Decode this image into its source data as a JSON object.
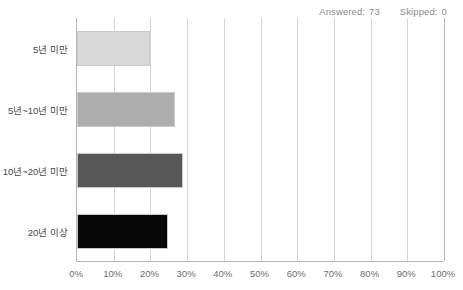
{
  "header": {
    "answered_label": "Answered:",
    "answered_value": "73",
    "skipped_label": "Skipped:",
    "skipped_value": "0"
  },
  "chart_data": {
    "type": "bar",
    "orientation": "horizontal",
    "title": "",
    "xlabel": "",
    "ylabel": "",
    "categories": [
      "5년 미만",
      "5년~10년 미만",
      "10년~20년 미만",
      "20년 이상"
    ],
    "values": [
      19.8,
      26.6,
      28.9,
      24.7
    ],
    "value_unit": "%",
    "xlim": [
      0,
      100
    ],
    "x_tick_labels": [
      "0%",
      "10%",
      "20%",
      "30%",
      "40%",
      "50%",
      "60%",
      "70%",
      "80%",
      "90%",
      "100%"
    ],
    "x_tick_values": [
      0,
      10,
      20,
      30,
      40,
      50,
      60,
      70,
      80,
      90,
      100
    ],
    "grid": true,
    "legend": "none",
    "bar_colors": [
      "#d9d9d9",
      "#adadad",
      "#575757",
      "#080808"
    ],
    "series": [
      {
        "name": "응답 비율",
        "values": [
          19.8,
          26.6,
          28.9,
          24.7
        ]
      }
    ]
  },
  "colors": {
    "axis": "#b5b5b5",
    "gridline": "#d6d6d6",
    "label_text": "#4a4a4a",
    "tick_text": "#6e6e6e",
    "header_text": "#8a8a8a",
    "background": "#ffffff"
  }
}
